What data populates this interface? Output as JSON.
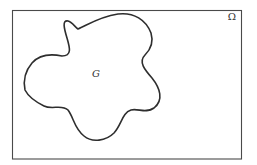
{
  "diagram": {
    "outer_set": {
      "label": "Ω",
      "description": "rectangular domain"
    },
    "inner_set": {
      "label": "G",
      "description": "irregular closed region inside the domain"
    }
  },
  "colors": {
    "background": "#ffffff",
    "outline": "#2e2e2e",
    "frame": "#4a4a4a"
  }
}
